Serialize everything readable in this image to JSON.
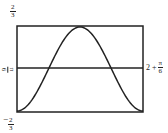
{
  "chart_data": {
    "type": "line",
    "title": "",
    "xlabel": "",
    "ylabel": "",
    "ylim": [
      -0.6667,
      0.6667
    ],
    "y_top_label": {
      "num": "2",
      "den": "3",
      "sign": ""
    },
    "y_bottom_label": {
      "num": "2",
      "den": "3",
      "sign": "−"
    },
    "hline": {
      "left_label": {
        "num": "π",
        "den": "6"
      },
      "right_label": {
        "prefix": "2 +",
        "num": "π",
        "den": "6"
      }
    },
    "series": [
      {
        "name": "curve",
        "shape": "raised cosine",
        "x": [
          0,
          0.25,
          0.5,
          0.75,
          1
        ],
        "values": [
          -0.6667,
          0,
          0.6667,
          0,
          -0.6667
        ]
      }
    ],
    "grid": false,
    "legend": "none",
    "color": "#222222"
  }
}
